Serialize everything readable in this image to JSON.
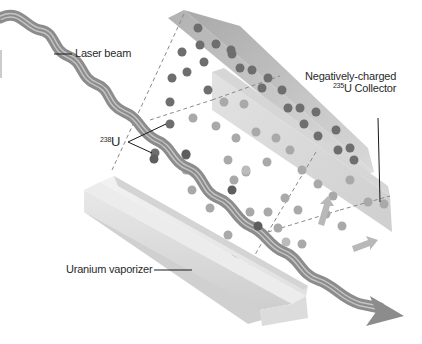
{
  "diagram": {
    "type": "laser isotope separation illustration",
    "labels": {
      "laser_beam": "Laser beam",
      "u238_sup": "238",
      "u238_base": "U",
      "collector_line1": "Negatively-charged",
      "collector_sup": "235",
      "collector_line2": "U Collector",
      "vaporizer": "Uranium vaporizer"
    },
    "colors": {
      "beam": "#8a8a8a",
      "beam_stripe": "#c8c8c8",
      "atom_dark": "#6a6a6a",
      "atom_mid": "#8e8e8e",
      "atom_light": "#b4b4b4",
      "collector_upper": "#bdbdbd",
      "collector_lower": "#dedede",
      "vaporizer": "#e6e6e6",
      "leader_line": "#1a1a1a"
    }
  }
}
